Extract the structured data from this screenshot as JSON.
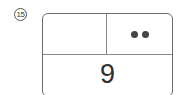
{
  "figure": {
    "label": "15",
    "label_style": "circled-number",
    "cells": {
      "top_left": "",
      "top_right": {
        "icon": "two-dots-icon",
        "dot_count": 2
      },
      "bottom": "9"
    }
  }
}
